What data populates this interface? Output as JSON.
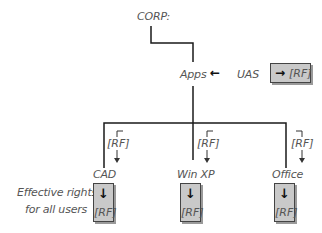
{
  "root": {
    "label": "CORP:"
  },
  "container": {
    "label": "Apps",
    "arrow": "←"
  },
  "assignment": {
    "trustee": "UAS",
    "box": {
      "arrow": "→",
      "rights": "[RF]"
    }
  },
  "children": [
    {
      "label": "CAD",
      "inherited": "[RF]",
      "effective": {
        "arrow": "↓",
        "rights": "[RF]"
      }
    },
    {
      "label": "Win XP",
      "inherited": "[RF]",
      "effective": {
        "arrow": "↓",
        "rights": "[RF]"
      }
    },
    {
      "label": "Office",
      "inherited": "[RF]",
      "effective": {
        "arrow": "↓",
        "rights": "[RF]"
      }
    }
  ],
  "note": {
    "line1": "Effective rights",
    "line2": "for all users"
  },
  "colors": {
    "line": "#1a1a1a",
    "text": "#555555",
    "box_fill": "#c9c9c9",
    "box_border": "#444444"
  }
}
